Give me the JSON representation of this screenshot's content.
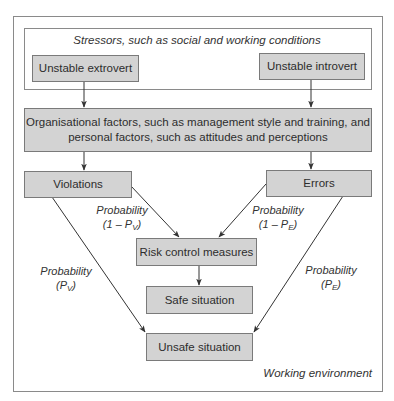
{
  "diagram": {
    "outer_frame": {
      "label": "Working environment"
    },
    "stressors_frame": {
      "label": "Stressors, such as social and working conditions"
    },
    "nodes": {
      "extrovert": "Unstable extrovert",
      "introvert": "Unstable introvert",
      "organisational_line1": "Organisational factors, such as management style and training, and",
      "organisational_line2": "personal factors, such as attitudes and perceptions",
      "violations": "Violations",
      "errors": "Errors",
      "risk_control": "Risk control measures",
      "safe": "Safe situation",
      "unsafe": "Unsafe situation"
    },
    "edge_labels": {
      "violations_to_risk": {
        "word": "Probability",
        "prefix": "(1 – P",
        "sub": "V",
        "suffix": ")"
      },
      "errors_to_risk": {
        "word": "Probability",
        "prefix": "(1 – P",
        "sub": "E",
        "suffix": ")"
      },
      "violations_to_unsafe": {
        "word": "Probability",
        "prefix": "(P",
        "sub": "V",
        "suffix": ")"
      },
      "errors_to_unsafe": {
        "word": "Probability",
        "prefix": "(P",
        "sub": "E",
        "suffix": ")"
      }
    },
    "colors": {
      "box_fill": "#d3d3d3",
      "box_border": "#7a7a7a",
      "line": "#333333",
      "frame": "#8a8a8a"
    }
  }
}
